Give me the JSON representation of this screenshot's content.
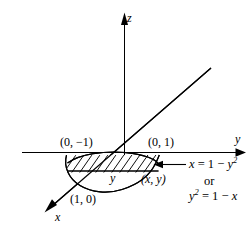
{
  "figure": {
    "type": "math-diagram",
    "background_color": "#ffffff",
    "stroke_color": "#000000"
  },
  "axes": {
    "z": {
      "label": "z",
      "direction": "up"
    },
    "y": {
      "label": "y",
      "direction": "right"
    },
    "x": {
      "label": "x",
      "direction": "down-left"
    }
  },
  "points": {
    "y_negative_one": "(0, −1)",
    "y_positive_one": "(0, 1)",
    "x_one": "(1, 0)",
    "generic": "(x, y)"
  },
  "region": {
    "inner_label": "y",
    "hatched": true
  },
  "equations": {
    "line1_prefix": "x",
    "line1_rhs": "1",
    "line1_sub": "y",
    "line1_full": "x = 1 − y²",
    "connector": "or",
    "line2_full": "y² = 1 − x"
  },
  "colors": {
    "stroke": "#000000",
    "fill": "#ffffff"
  }
}
